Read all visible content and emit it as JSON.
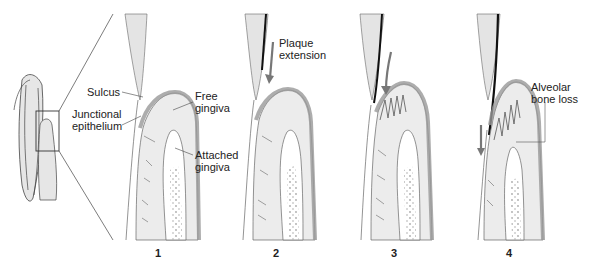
{
  "figure": {
    "type": "periodontal disease progression diagram",
    "panels": [
      {
        "number": "1",
        "labels": [
          "Sulcus",
          "Junctional epithelium",
          "Free gingiva",
          "Attached gingiva"
        ]
      },
      {
        "number": "2",
        "labels": [
          "Plaque extension"
        ]
      },
      {
        "number": "3",
        "labels": []
      },
      {
        "number": "4",
        "labels": [
          "Alveolar bone loss"
        ]
      }
    ],
    "labels": {
      "sulcus": "Sulcus",
      "junctional_1": "Junctional",
      "junctional_2": "epithelium",
      "free_1": "Free",
      "free_2": "gingiva",
      "attached_1": "Attached",
      "attached_2": "gingiva",
      "plaque_1": "Plaque",
      "plaque_2": "extension",
      "bone_1": "Alveolar",
      "bone_2": "bone loss"
    },
    "numbers": [
      "1",
      "2",
      "3",
      "4"
    ],
    "colors": {
      "tissue_fill": "#ececec",
      "gingiva_band": "#b8b8b8",
      "outline": "#555555",
      "plaque": "#111111",
      "arrow": "#777777",
      "bone_dots": "#aaaaaa"
    }
  }
}
